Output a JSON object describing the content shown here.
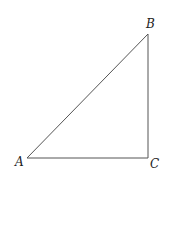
{
  "diagram": {
    "type": "right-triangle",
    "vertices": {
      "A": {
        "label": "A",
        "x": 27,
        "y": 158
      },
      "B": {
        "label": "B",
        "x": 148,
        "y": 34
      },
      "C": {
        "label": "C",
        "x": 148,
        "y": 158
      }
    },
    "edges": [
      [
        "A",
        "B"
      ],
      [
        "B",
        "C"
      ],
      [
        "A",
        "C"
      ]
    ],
    "right_angle_at": "C",
    "colors": {
      "line": "#555555",
      "text": "#222222",
      "background": "#ffffff"
    }
  }
}
